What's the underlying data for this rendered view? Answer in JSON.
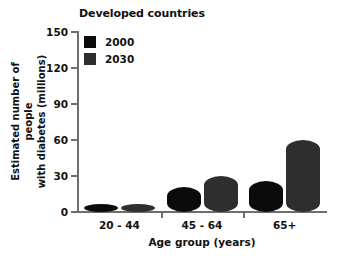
{
  "chart_data": {
    "type": "bar",
    "title": "Developed countries",
    "xlabel": "Age group (years)",
    "ylabel_line1": "Estimated number of people",
    "ylabel_line2": "with diabetes (millions)",
    "categories": [
      "20 - 44",
      "45 - 64",
      "65+"
    ],
    "series": [
      {
        "name": "2000",
        "color": "#0b0b0b",
        "values": [
          7,
          21,
          26
        ]
      },
      {
        "name": "2030",
        "color": "#2e2e2e",
        "values": [
          7,
          30,
          60
        ]
      }
    ],
    "ylim": [
      0,
      150
    ],
    "yticks": [
      0,
      30,
      60,
      90,
      120,
      150
    ],
    "ytick_labels": [
      "0",
      "30",
      "60",
      "90",
      "120",
      "150"
    ],
    "grid": false,
    "legend_position": "top-left"
  },
  "axis_color": "#6e6e6e",
  "background": "#ffffff"
}
